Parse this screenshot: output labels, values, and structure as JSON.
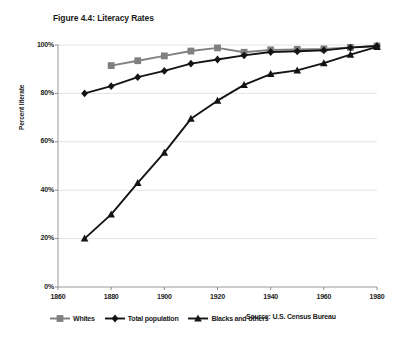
{
  "figure": {
    "title": "Figure 4.4: Literacy Rates",
    "source": "Source: U.S. Census Bureau"
  },
  "chart_data": {
    "type": "line",
    "title": "Figure 4.4: Literacy Rates",
    "xlabel": "",
    "ylabel": "Percent literate",
    "xlim": [
      1860,
      1980
    ],
    "ylim": [
      0,
      100
    ],
    "xticks": [
      1860,
      1880,
      1900,
      1920,
      1940,
      1960,
      1980
    ],
    "xtick_labels": [
      "1860",
      "1880",
      "1900",
      "1920",
      "1940",
      "1960",
      "1980"
    ],
    "yticks": [
      0,
      20,
      40,
      60,
      80,
      100
    ],
    "ytick_labels": [
      "0%",
      "20%",
      "40%",
      "60%",
      "80%",
      "100%"
    ],
    "grid": true,
    "legend_position": "below",
    "series": [
      {
        "name": "Whites",
        "marker": "square",
        "color": "#808080",
        "x": [
          1880,
          1890,
          1900,
          1910,
          1920,
          1930,
          1940,
          1950,
          1960,
          1970,
          1980
        ],
        "values": [
          91.5,
          93.5,
          95.5,
          97.5,
          98.8,
          97.0,
          98.0,
          98.2,
          98.4,
          99.0,
          99.6
        ]
      },
      {
        "name": "Total population",
        "marker": "diamond",
        "color": "#141414",
        "x": [
          1870,
          1880,
          1890,
          1900,
          1910,
          1920,
          1930,
          1940,
          1950,
          1960,
          1970,
          1980
        ],
        "values": [
          80.0,
          83.0,
          86.7,
          89.3,
          92.3,
          94.0,
          95.7,
          97.1,
          97.4,
          97.8,
          98.9,
          99.6
        ]
      },
      {
        "name": "Blacks and others",
        "marker": "triangle",
        "color": "#141414",
        "x": [
          1870,
          1880,
          1890,
          1900,
          1910,
          1920,
          1930,
          1940,
          1950,
          1960,
          1970,
          1980
        ],
        "values": [
          20.0,
          30.0,
          43.0,
          55.5,
          69.5,
          77.0,
          83.5,
          88.0,
          89.5,
          92.5,
          96.0,
          99.2
        ]
      }
    ]
  },
  "legend": {
    "items": [
      {
        "label": "Whites",
        "marker": "square",
        "color": "#808080"
      },
      {
        "label": "Total population",
        "marker": "diamond",
        "color": "#141414"
      },
      {
        "label": "Blacks and others",
        "marker": "triangle",
        "color": "#141414"
      }
    ]
  }
}
